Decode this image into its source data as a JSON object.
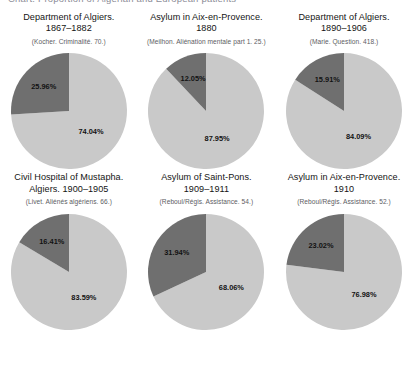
{
  "figure": {
    "clipped_header": "Chart. Proportion of Algerian and European patients",
    "colors": {
      "major_slice": "#c9c9c9",
      "minor_slice": "#6f6f6f",
      "label_text": "#121212",
      "caption_text": "#141414",
      "source_text": "#5d5d63",
      "background": "#ffffff"
    }
  },
  "chart_data": [
    {
      "type": "pie",
      "title": "Department of Algiers.",
      "subtitle": "1867–1882",
      "source": "(Kocher. Criminalité. 70.)",
      "labels": [
        "74.04%",
        "25.96%"
      ],
      "values": [
        74.04,
        25.96
      ],
      "colors": [
        "#c9c9c9",
        "#6f6f6f"
      ],
      "start_angle": 0,
      "direction": "counterclockwise",
      "legend": "none",
      "grid": false
    },
    {
      "type": "pie",
      "title": "Asylum in Aix-en-Provence.",
      "subtitle": "1880",
      "source": "(Meilhon. Aliénation mentale part 1. 25.)",
      "labels": [
        "87.95%",
        "12.05%"
      ],
      "values": [
        87.95,
        12.05
      ],
      "colors": [
        "#c9c9c9",
        "#6f6f6f"
      ],
      "start_angle": 0,
      "direction": "counterclockwise",
      "legend": "none",
      "grid": false
    },
    {
      "type": "pie",
      "title": "Department of Algiers.",
      "subtitle": "1890–1906",
      "source": "(Marie. Question. 418.)",
      "labels": [
        "84.09%",
        "15.91%"
      ],
      "values": [
        84.09,
        15.91
      ],
      "colors": [
        "#c9c9c9",
        "#6f6f6f"
      ],
      "start_angle": 0,
      "direction": "counterclockwise",
      "legend": "none",
      "grid": false
    },
    {
      "type": "pie",
      "title": "Civil Hospital of Mustapha.",
      "subtitle": "Algiers. 1900–1905",
      "source": "(Livet. Aliénés algériens. 66.)",
      "labels": [
        "83.59%",
        "16.41%"
      ],
      "values": [
        83.59,
        16.41
      ],
      "colors": [
        "#c9c9c9",
        "#6f6f6f"
      ],
      "start_angle": 0,
      "direction": "counterclockwise",
      "legend": "none",
      "grid": false
    },
    {
      "type": "pie",
      "title": "Asylum of Saint-Pons.",
      "subtitle": "1909–1911",
      "source": "(Reboul/Régis. Assistance. 54.)",
      "labels": [
        "68.06%",
        "31.94%"
      ],
      "values": [
        68.06,
        31.94
      ],
      "colors": [
        "#c9c9c9",
        "#6f6f6f"
      ],
      "start_angle": 0,
      "direction": "counterclockwise",
      "legend": "none",
      "grid": false
    },
    {
      "type": "pie",
      "title": "Asylum in Aix-en-Provence.",
      "subtitle": "1910",
      "source": "(Reboul/Régis. Assistance. 52.)",
      "labels": [
        "76.98%",
        "23.02%"
      ],
      "values": [
        76.98,
        23.02
      ],
      "colors": [
        "#c9c9c9",
        "#6f6f6f"
      ],
      "start_angle": 0,
      "direction": "counterclockwise",
      "legend": "none",
      "grid": false
    }
  ]
}
